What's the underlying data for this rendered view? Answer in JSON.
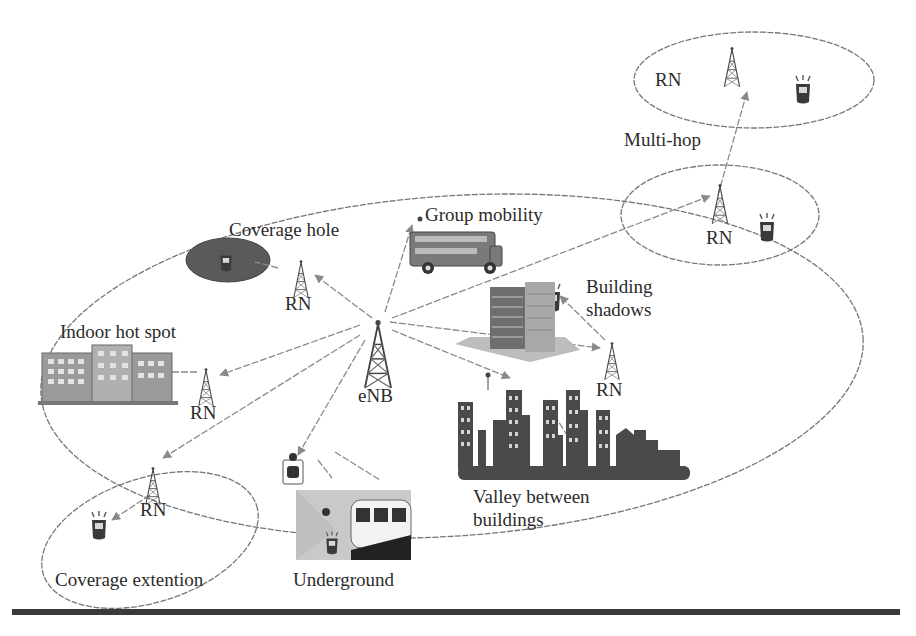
{
  "diagram": {
    "base_station": {
      "label": "eNB"
    },
    "relay_label": "RN",
    "scenarios": [
      {
        "id": "multi-hop",
        "label": "Multi-hop"
      },
      {
        "id": "group-mobility",
        "label": "Group mobility"
      },
      {
        "id": "coverage-hole",
        "label": "Coverage hole"
      },
      {
        "id": "building-shadows",
        "label_line1": "Building",
        "label_line2": "shadows"
      },
      {
        "id": "indoor-hot-spot",
        "label": "Indoor hot spot"
      },
      {
        "id": "valley-between-buildings",
        "label_line1": "Valley between",
        "label_line2": "buildings"
      },
      {
        "id": "coverage-extention",
        "label": "Coverage extention"
      },
      {
        "id": "underground",
        "label": "Underground"
      }
    ],
    "relay_nodes": [
      {
        "id": "rn-multihop-top",
        "label": "RN"
      },
      {
        "id": "rn-multihop-mid",
        "label": "RN"
      },
      {
        "id": "rn-coverage-hole",
        "label": "RN"
      },
      {
        "id": "rn-indoor",
        "label": "RN"
      },
      {
        "id": "rn-building-shadows",
        "label": "RN"
      },
      {
        "id": "rn-coverage-extension",
        "label": "RN"
      }
    ],
    "colors": {
      "line": "#7a7a7a",
      "text": "#2b2b2b",
      "coverage_hole_fill": "#5a5a5a",
      "city_fill": "#4a4a4a",
      "rule": "#3a3a3a"
    }
  }
}
